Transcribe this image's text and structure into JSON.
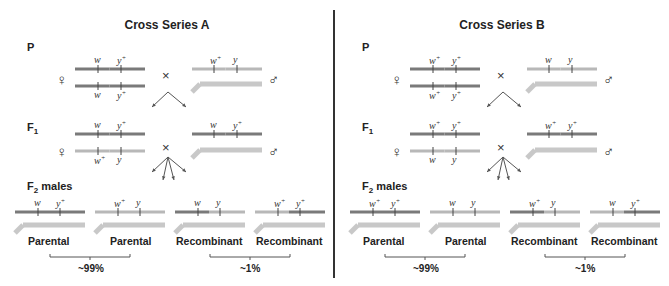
{
  "colors": {
    "dark_chromosome": "#7a7a7a",
    "light_chromosome": "#b8b8b8",
    "y_chromosome": "#c8c8c8",
    "text": "#222222",
    "divider": "#333333"
  },
  "symbols": {
    "female": "♀",
    "male": "♂",
    "cross": "×"
  },
  "panels": [
    {
      "title": "Cross Series A",
      "generations": {
        "p": "P",
        "f1": "F",
        "f1_sub": "1",
        "f2": "F",
        "f2_sub": "2",
        "f2_suffix": " males"
      },
      "p_female": {
        "top": [
          "w",
          "y+"
        ],
        "bottom": [
          "w",
          "y+"
        ],
        "shade": "dark"
      },
      "p_male": {
        "x": [
          "w+",
          "y"
        ],
        "shade": "light"
      },
      "f1_female": {
        "top": [
          "w",
          "y+"
        ],
        "bottom": [
          "w+",
          "y"
        ]
      },
      "f1_male": {
        "x": [
          "w",
          "y+"
        ]
      },
      "f2": [
        {
          "alleles": [
            "w",
            "y+"
          ],
          "class": "Parental"
        },
        {
          "alleles": [
            "w+",
            "y"
          ],
          "class": "Parental"
        },
        {
          "alleles": [
            "w",
            "y"
          ],
          "class": "Recombinant"
        },
        {
          "alleles": [
            "w+",
            "y+"
          ],
          "class": "Recombinant"
        }
      ],
      "parental_pct": "~99%",
      "recombinant_pct": "~1%"
    },
    {
      "title": "Cross Series B",
      "generations": {
        "p": "P",
        "f1": "F",
        "f1_sub": "1",
        "f2": "F",
        "f2_sub": "2",
        "f2_suffix": " males"
      },
      "p_female": {
        "top": [
          "w+",
          "y+"
        ],
        "bottom": [
          "w+",
          "y+"
        ],
        "shade": "dark"
      },
      "p_male": {
        "x": [
          "w",
          "y"
        ],
        "shade": "light"
      },
      "f1_female": {
        "top": [
          "w+",
          "y+"
        ],
        "bottom": [
          "w",
          "y"
        ]
      },
      "f1_male": {
        "x": [
          "w+",
          "y+"
        ]
      },
      "f2": [
        {
          "alleles": [
            "w+",
            "y+"
          ],
          "class": "Parental"
        },
        {
          "alleles": [
            "w",
            "y"
          ],
          "class": "Parental"
        },
        {
          "alleles": [
            "w+",
            "y"
          ],
          "class": "Recombinant"
        },
        {
          "alleles": [
            "w",
            "y+"
          ],
          "class": "Recombinant"
        }
      ],
      "parental_pct": "~99%",
      "recombinant_pct": "~1%"
    }
  ]
}
